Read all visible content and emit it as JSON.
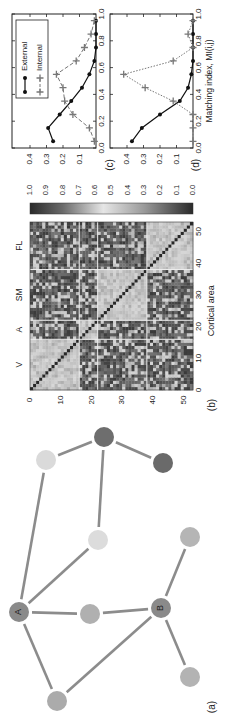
{
  "figure": {
    "rotation_deg": -90,
    "panel_labels": {
      "a": "(a)",
      "b": "(b)",
      "c": "(c)",
      "d": "(d)"
    }
  },
  "network": {
    "nodes": [
      {
        "id": "A",
        "label": "A",
        "x": 19,
        "y": 612,
        "r": 10,
        "fill": "#8a8a8a"
      },
      {
        "id": "B",
        "label": "B",
        "x": 161,
        "y": 608,
        "r": 10,
        "fill": "#8a8a8a"
      },
      {
        "id": "m1",
        "label": "",
        "x": 90,
        "y": 614,
        "r": 10,
        "fill": "#b0b0b0"
      },
      {
        "id": "bl",
        "label": "",
        "x": 57,
        "y": 701,
        "r": 10,
        "fill": "#ababab"
      },
      {
        "id": "br",
        "label": "",
        "x": 190,
        "y": 677,
        "r": 10,
        "fill": "#b3b3b3"
      },
      {
        "id": "rt",
        "label": "",
        "x": 190,
        "y": 537,
        "r": 10,
        "fill": "#b5b5b5"
      },
      {
        "id": "lm",
        "label": "",
        "x": 98,
        "y": 540,
        "r": 10,
        "fill": "#dcdcdc"
      },
      {
        "id": "ll",
        "label": "",
        "x": 46,
        "y": 460,
        "r": 10,
        "fill": "#dadada"
      },
      {
        "id": "td",
        "label": "",
        "x": 104,
        "y": 437,
        "r": 10,
        "fill": "#6e6e6e"
      },
      {
        "id": "dr",
        "label": "",
        "x": 163,
        "y": 463,
        "r": 10,
        "fill": "#6a6a6a"
      }
    ],
    "edges": [
      [
        "A",
        "ll"
      ],
      [
        "A",
        "lm"
      ],
      [
        "A",
        "m1"
      ],
      [
        "A",
        "bl"
      ],
      [
        "m1",
        "B"
      ],
      [
        "B",
        "bl"
      ],
      [
        "B",
        "br"
      ],
      [
        "B",
        "rt"
      ],
      [
        "td",
        "ll"
      ],
      [
        "td",
        "dr"
      ],
      [
        "td",
        "lm"
      ]
    ],
    "edge_color": "#8c8c8c"
  },
  "matrix": {
    "size": 53,
    "modules": [
      {
        "name": "V",
        "start": 0,
        "end": 16
      },
      {
        "name": "A",
        "start": 16,
        "end": 22
      },
      {
        "name": "SM",
        "start": 22,
        "end": 38
      },
      {
        "name": "FL",
        "start": 38,
        "end": 53
      }
    ],
    "ticks": [
      0,
      10,
      20,
      30,
      40,
      50
    ],
    "tick_labels": [
      "0",
      "10",
      "20",
      "30",
      "40",
      "50"
    ],
    "xlabel": "Cortical area",
    "colorbar": {
      "ticks": [
        "1.0",
        "0.9",
        "0.8",
        "0.7",
        "0.6",
        "0.5",
        "0.4",
        "0.3",
        "0.2",
        "0.1",
        "0.0"
      ]
    }
  },
  "chart_data": [
    {
      "panel": "(c)",
      "type": "line",
      "x": [
        0.05,
        0.15,
        0.25,
        0.35,
        0.45,
        0.55,
        0.65,
        0.75,
        0.85,
        0.95
      ],
      "series": [
        {
          "name": "External",
          "marker": "dot",
          "style": "solid",
          "values": [
            0.26,
            0.29,
            0.22,
            0.15,
            0.085,
            0.04,
            0.01,
            0.0,
            0.0,
            0.0
          ]
        },
        {
          "name": "Internal",
          "marker": "plus",
          "style": "dashed",
          "values": [
            0.01,
            0.04,
            0.14,
            0.19,
            0.2,
            0.24,
            0.12,
            0.07,
            0.03,
            0.01
          ]
        }
      ],
      "xlim": [
        0.0,
        1.0
      ],
      "ylim": [
        0.0,
        0.47
      ],
      "xticks": [
        "0.0",
        "0.2",
        "0.4",
        "0.6",
        "0.8",
        "1.0"
      ],
      "yticks": [
        "0.1",
        "0.2",
        "0.3",
        "0.4"
      ],
      "legend": [
        "External",
        "Internal"
      ],
      "xlabel": "",
      "ylabel": ""
    },
    {
      "panel": "(d)",
      "type": "line",
      "x": [
        0.05,
        0.15,
        0.25,
        0.35,
        0.45,
        0.55,
        0.65,
        0.75,
        0.85,
        0.95
      ],
      "series": [
        {
          "name": "External",
          "marker": "dot",
          "style": "solid",
          "values": [
            0.37,
            0.31,
            0.2,
            0.08,
            0.03,
            0.01,
            0.0,
            0.0,
            0.0,
            0.0
          ]
        },
        {
          "name": "Internal",
          "marker": "plus",
          "style": "dotted",
          "values": [
            0.0,
            0.0,
            0.0,
            0.12,
            0.29,
            0.42,
            0.12,
            0.0,
            0.03,
            0.0
          ]
        }
      ],
      "xlim": [
        0.0,
        1.0
      ],
      "ylim": [
        0.0,
        0.47
      ],
      "xticks": [
        "0.0",
        "0.2",
        "0.4",
        "0.6",
        "0.8",
        "1.0"
      ],
      "yticks": [
        "0.1",
        "0.2",
        "0.3",
        "0.4"
      ],
      "xlabel": "Matching index, MI(i,j)",
      "ylabel": ""
    }
  ]
}
